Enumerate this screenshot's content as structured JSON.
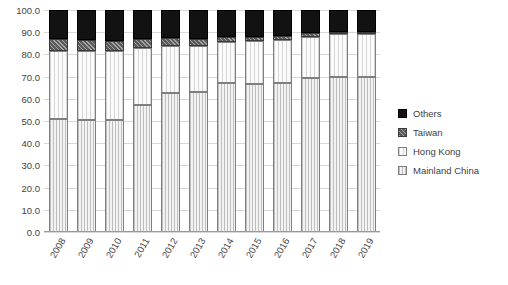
{
  "chart_data": {
    "type": "bar",
    "subtype": "stacked-100-percent",
    "title": "",
    "xlabel": "",
    "ylabel": "",
    "ylim": [
      0,
      100
    ],
    "ytick_labels": [
      "0.0",
      "10.0",
      "20.0",
      "30.0",
      "40.0",
      "50.0",
      "60.0",
      "70.0",
      "80.0",
      "90.0",
      "100.0"
    ],
    "ytick_values": [
      0,
      10,
      20,
      30,
      40,
      50,
      60,
      70,
      80,
      90,
      100
    ],
    "grid": true,
    "legend_position": "right",
    "categories": [
      "2008",
      "2009",
      "2010",
      "2011",
      "2012",
      "2013",
      "2014",
      "2015",
      "2016",
      "2017",
      "2018",
      "2019"
    ],
    "series": [
      {
        "name": "Mainland China",
        "values": [
          51.0,
          50.5,
          50.3,
          57.0,
          62.5,
          63.0,
          67.0,
          66.5,
          67.0,
          69.5,
          70.0,
          70.0
        ]
      },
      {
        "name": "Hong Kong",
        "values": [
          30.5,
          31.0,
          31.2,
          26.0,
          21.5,
          21.0,
          18.5,
          19.5,
          19.5,
          18.5,
          19.0,
          19.0
        ]
      },
      {
        "name": "Taiwan",
        "values": [
          5.5,
          5.0,
          4.5,
          4.0,
          3.5,
          3.0,
          2.5,
          2.0,
          2.0,
          1.5,
          1.0,
          1.0
        ]
      },
      {
        "name": "Others",
        "values": [
          13.0,
          13.5,
          14.0,
          13.0,
          12.5,
          13.0,
          12.0,
          12.0,
          11.5,
          10.5,
          10.0,
          10.0
        ]
      }
    ]
  },
  "legend": {
    "items": [
      {
        "label": "Others",
        "swatch": "others"
      },
      {
        "label": "Taiwan",
        "swatch": "taiwan"
      },
      {
        "label": "Hong Kong",
        "swatch": "hk"
      },
      {
        "label": "Mainland China",
        "swatch": "mainland"
      }
    ]
  }
}
